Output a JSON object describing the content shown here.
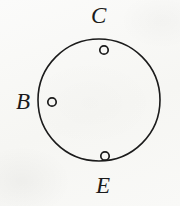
{
  "figure": {
    "type": "geometry-diagram",
    "background_color": "#f8f8f6",
    "ink_color": "#1b1b1b"
  },
  "main_circle": {
    "name": "large-circle",
    "center_x": 99,
    "center_y": 100,
    "radius": 61,
    "stroke_width": 1.6,
    "stroke_color": "#1b1b1b",
    "fill": "none"
  },
  "points": [
    {
      "id": "point-C",
      "label": "C",
      "marker": "open-circle",
      "x": 104,
      "y": 50,
      "radius": 4.2,
      "label_x": 91,
      "label_y": 4
    },
    {
      "id": "point-B",
      "label": "B",
      "marker": "open-circle",
      "x": 52,
      "y": 102,
      "radius": 4.2,
      "label_x": 16,
      "label_y": 90
    },
    {
      "id": "point-E",
      "label": "E",
      "marker": "open-circle",
      "x": 105,
      "y": 156,
      "radius": 4.2,
      "label_x": 96,
      "label_y": 174
    }
  ],
  "labels": {
    "c": "C",
    "b": "B",
    "e": "E"
  }
}
